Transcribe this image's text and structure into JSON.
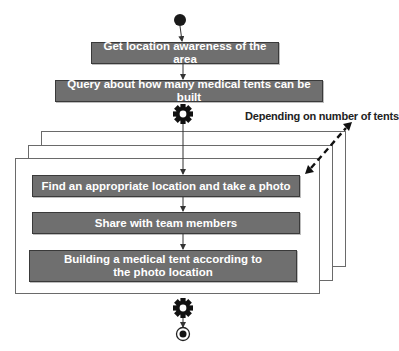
{
  "diagram": {
    "type": "activity-diagram",
    "start_node": "start",
    "end_node": "end",
    "steps": [
      {
        "id": "s1",
        "label": "Get location  awareness of the area"
      },
      {
        "id": "s2",
        "label": "Query about how many medical tents can be built"
      }
    ],
    "fork_icon_1": "gear-icon",
    "loop": {
      "note": "Depending on number of tents",
      "stack_count": 3,
      "steps": [
        {
          "id": "l1",
          "label": "Find an appropriate location and take a photo"
        },
        {
          "id": "l2",
          "label": "Share with team members"
        },
        {
          "id": "l3",
          "label": "Building a medical tent according to the photo location"
        }
      ]
    },
    "fork_icon_2": "gear-icon",
    "colors": {
      "box_fill": "#6f6f6f",
      "box_text": "#ffffff",
      "frame_border": "#6a6a6a",
      "arrow": "#333333"
    }
  }
}
